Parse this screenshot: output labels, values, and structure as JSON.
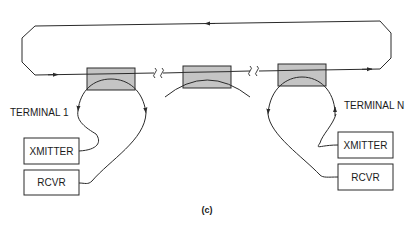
{
  "diagram": {
    "caption": "(c)",
    "colors": {
      "line": "#2a2a2a",
      "coupler_fill": "#c4c4c4",
      "background": "#ffffff"
    },
    "ring": {
      "name": "bus-loop",
      "direction_top": "right-to-left",
      "direction_bottom": "left-to-right"
    },
    "couplers": [
      {
        "id": "coupler-1"
      },
      {
        "id": "coupler-middle"
      },
      {
        "id": "coupler-n"
      }
    ],
    "terminals": [
      {
        "label": "TERMINAL 1",
        "transmitter": "XMITTER",
        "receiver": "RCVR"
      },
      {
        "label": "TERMINAL N",
        "transmitter": "XMITTER",
        "receiver": "RCVR"
      }
    ]
  }
}
